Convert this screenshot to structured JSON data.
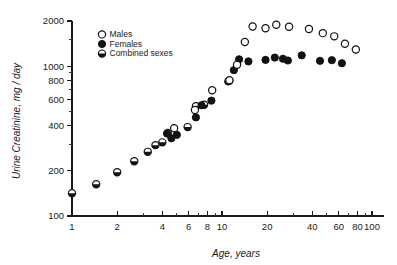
{
  "chart_data": {
    "type": "scatter",
    "title": "",
    "xlabel": "Age, years",
    "ylabel": "Urine Creatinine, mg / day",
    "xscale": "log",
    "yscale": "log",
    "xlim": [
      1,
      100
    ],
    "ylim": [
      100,
      2000
    ],
    "grid": false,
    "legend_position": "upper-left-inside",
    "x_tick_labels": [
      "1",
      "2",
      "4",
      "6",
      "8",
      "10",
      "20",
      "40",
      "60",
      "80",
      "100"
    ],
    "x_tick_values": [
      1,
      2,
      4,
      6,
      8,
      10,
      20,
      40,
      60,
      80,
      100
    ],
    "x_minor_ticks": [
      3,
      5,
      7,
      9,
      30,
      50,
      70,
      90
    ],
    "y_tick_labels": [
      "100",
      "200",
      "400",
      "600",
      "800",
      "1000",
      "2000"
    ],
    "y_tick_values": [
      100,
      200,
      400,
      600,
      800,
      1000,
      2000
    ],
    "y_minor_ticks": [
      300,
      500,
      700,
      900,
      1500
    ],
    "series": [
      {
        "name": "Males",
        "marker": "open-circle",
        "color": "#111111",
        "points": [
          {
            "x": 4.8,
            "y": 385
          },
          {
            "x": 6.6,
            "y": 510
          },
          {
            "x": 8.6,
            "y": 690
          },
          {
            "x": 11.2,
            "y": 805
          },
          {
            "x": 12.6,
            "y": 1020
          },
          {
            "x": 14.2,
            "y": 1450
          },
          {
            "x": 16.0,
            "y": 1840
          },
          {
            "x": 19.5,
            "y": 1790
          },
          {
            "x": 23.0,
            "y": 1890
          },
          {
            "x": 28.0,
            "y": 1830
          },
          {
            "x": 38.0,
            "y": 1770
          },
          {
            "x": 47.0,
            "y": 1660
          },
          {
            "x": 56.0,
            "y": 1580
          },
          {
            "x": 66.0,
            "y": 1410
          },
          {
            "x": 78.0,
            "y": 1290
          }
        ]
      },
      {
        "name": "Females",
        "marker": "filled-circle",
        "color": "#111111",
        "points": [
          {
            "x": 4.3,
            "y": 355
          },
          {
            "x": 4.6,
            "y": 330
          },
          {
            "x": 5.0,
            "y": 348
          },
          {
            "x": 6.7,
            "y": 455
          },
          {
            "x": 7.3,
            "y": 548
          },
          {
            "x": 8.5,
            "y": 588
          },
          {
            "x": 11.0,
            "y": 790
          },
          {
            "x": 12.0,
            "y": 940
          },
          {
            "x": 13.0,
            "y": 1110
          },
          {
            "x": 15.0,
            "y": 1075
          },
          {
            "x": 19.5,
            "y": 1100
          },
          {
            "x": 22.5,
            "y": 1140
          },
          {
            "x": 25.5,
            "y": 1120
          },
          {
            "x": 27.5,
            "y": 1090
          },
          {
            "x": 34.0,
            "y": 1180
          },
          {
            "x": 45.0,
            "y": 1085
          },
          {
            "x": 54.0,
            "y": 1095
          },
          {
            "x": 63.0,
            "y": 1045
          }
        ]
      },
      {
        "name": "Combined sexes",
        "marker": "half-filled-circle",
        "color": "#111111",
        "points": [
          {
            "x": 1.0,
            "y": 142
          },
          {
            "x": 1.45,
            "y": 163
          },
          {
            "x": 2.0,
            "y": 196
          },
          {
            "x": 2.6,
            "y": 232
          },
          {
            "x": 3.2,
            "y": 268
          },
          {
            "x": 3.6,
            "y": 297
          },
          {
            "x": 4.0,
            "y": 310
          },
          {
            "x": 4.35,
            "y": 358
          },
          {
            "x": 5.9,
            "y": 392
          },
          {
            "x": 6.7,
            "y": 540
          },
          {
            "x": 7.6,
            "y": 552
          },
          {
            "x": 11.2,
            "y": 800
          }
        ]
      }
    ]
  },
  "legend": {
    "items": [
      {
        "label": "Males",
        "marker": "open-circle"
      },
      {
        "label": "Females",
        "marker": "filled-circle"
      },
      {
        "label": "Combined sexes",
        "marker": "half-filled-circle"
      }
    ]
  },
  "axes": {
    "x_title": "Age, years",
    "y_title": "Urine Creatinine, mg / day"
  }
}
